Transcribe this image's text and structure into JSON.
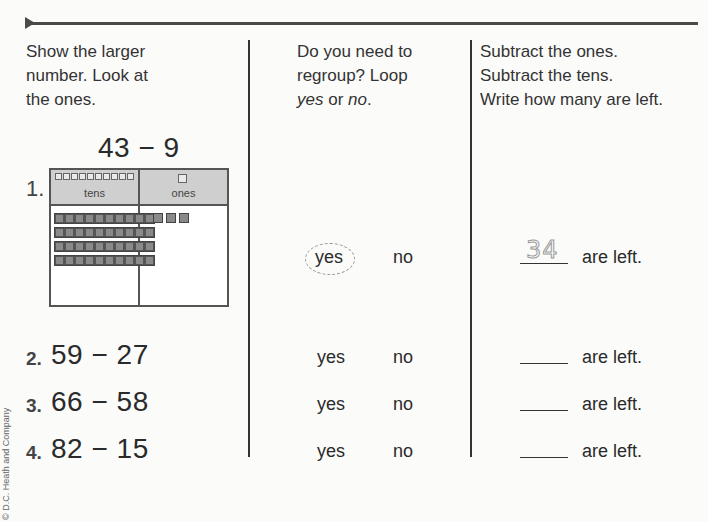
{
  "instructions": {
    "col1": [
      "Show the larger",
      "number. Look at",
      "the ones."
    ],
    "col2": [
      "Do you need to",
      "regroup? Loop"
    ],
    "col2_last": {
      "yes": "yes",
      "or": " or ",
      "no": "no",
      "period": "."
    },
    "col3": [
      "Subtract the ones.",
      "Subtract the tens.",
      "Write how many are left."
    ]
  },
  "example": {
    "number": "1.",
    "problem": "43 − 9",
    "place_value_chart": {
      "tens_label": "tens",
      "ones_label": "ones",
      "tens_rods": 4,
      "ones_units": 3
    },
    "choice_yes": "yes",
    "choice_no": "no",
    "selected": "yes",
    "answer": "34",
    "suffix": "are left."
  },
  "problems": [
    {
      "number": "2.",
      "expression": "59 − 27",
      "yes": "yes",
      "no": "no",
      "answer": "",
      "suffix": "are left."
    },
    {
      "number": "3.",
      "expression": "66 − 58",
      "yes": "yes",
      "no": "no",
      "answer": "",
      "suffix": "are left."
    },
    {
      "number": "4.",
      "expression": "82 − 15",
      "yes": "yes",
      "no": "no",
      "answer": "",
      "suffix": "are left."
    }
  ],
  "copyright": "© D.C. Heath and Company"
}
